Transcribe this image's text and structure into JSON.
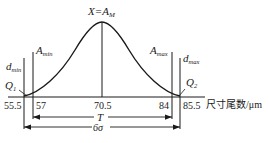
{
  "diagram": {
    "type": "normal-distribution-tolerance",
    "peak_label": {
      "main": "X=A",
      "sub": "M"
    },
    "limits": {
      "d_min": {
        "main": "d",
        "sub": "min"
      },
      "A_min": {
        "main": "A",
        "sub": "min"
      },
      "A_max": {
        "main": "A",
        "sub": "max"
      },
      "d_max": {
        "main": "d",
        "sub": "max"
      }
    },
    "points": {
      "Q1": {
        "main": "Q",
        "sub": "1"
      },
      "Q2": {
        "main": "Q",
        "sub": "2"
      }
    },
    "x_ticks": [
      "55.5",
      "57",
      "70.5",
      "84",
      "85.5"
    ],
    "x_axis_label": "尺寸尾数/μm",
    "dimensions": {
      "tolerance": "T",
      "spread": "6σ"
    },
    "colors": {
      "line": "#1a1a1a",
      "background": "#ffffff"
    }
  }
}
